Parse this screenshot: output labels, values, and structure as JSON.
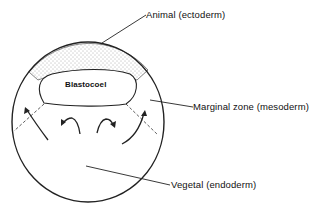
{
  "diagram": {
    "type": "blastula-fate-map",
    "labels": {
      "animal": "Animal (ectoderm)",
      "marginal": "Marginal zone (mesoderm)",
      "vegetal": "Vegetal (endoderm)",
      "blastocoel": "Blastocoel"
    },
    "colors": {
      "stroke": "#222222",
      "background": "#ffffff"
    }
  }
}
